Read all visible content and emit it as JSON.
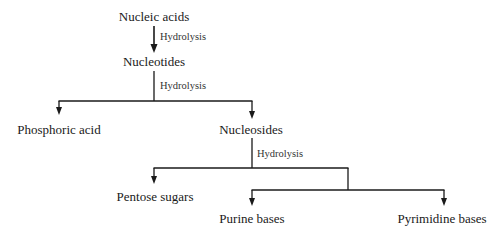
{
  "diagram": {
    "type": "flowchart",
    "colors": {
      "line": "#1a1a1a",
      "text": "#1a1a1a",
      "edge_label": "#333333",
      "background": "#ffffff"
    },
    "nodes": {
      "nucleic_acids": "Nucleic acids",
      "nucleotides": "Nucleotides",
      "phosphoric_acid": "Phosphoric acid",
      "nucleosides": "Nucleosides",
      "pentose_sugars": "Pentose sugars",
      "purine_bases": "Purine bases",
      "pyrimidine_bases": "Pyrimidine bases"
    },
    "edge_labels": {
      "step1": "Hydrolysis",
      "step2": "Hydrolysis",
      "step3": "Hydrolysis"
    },
    "edges": [
      {
        "from": "Nucleic acids",
        "to": "Nucleotides",
        "label": "Hydrolysis"
      },
      {
        "from": "Nucleotides",
        "to": "Phosphoric acid",
        "label": "Hydrolysis"
      },
      {
        "from": "Nucleotides",
        "to": "Nucleosides",
        "label": "Hydrolysis"
      },
      {
        "from": "Nucleosides",
        "to": "Pentose sugars",
        "label": "Hydrolysis"
      },
      {
        "from": "Nucleosides",
        "to": "Purine bases",
        "label": "Hydrolysis"
      },
      {
        "from": "Nucleosides",
        "to": "Pyrimidine bases",
        "label": "Hydrolysis"
      }
    ]
  }
}
